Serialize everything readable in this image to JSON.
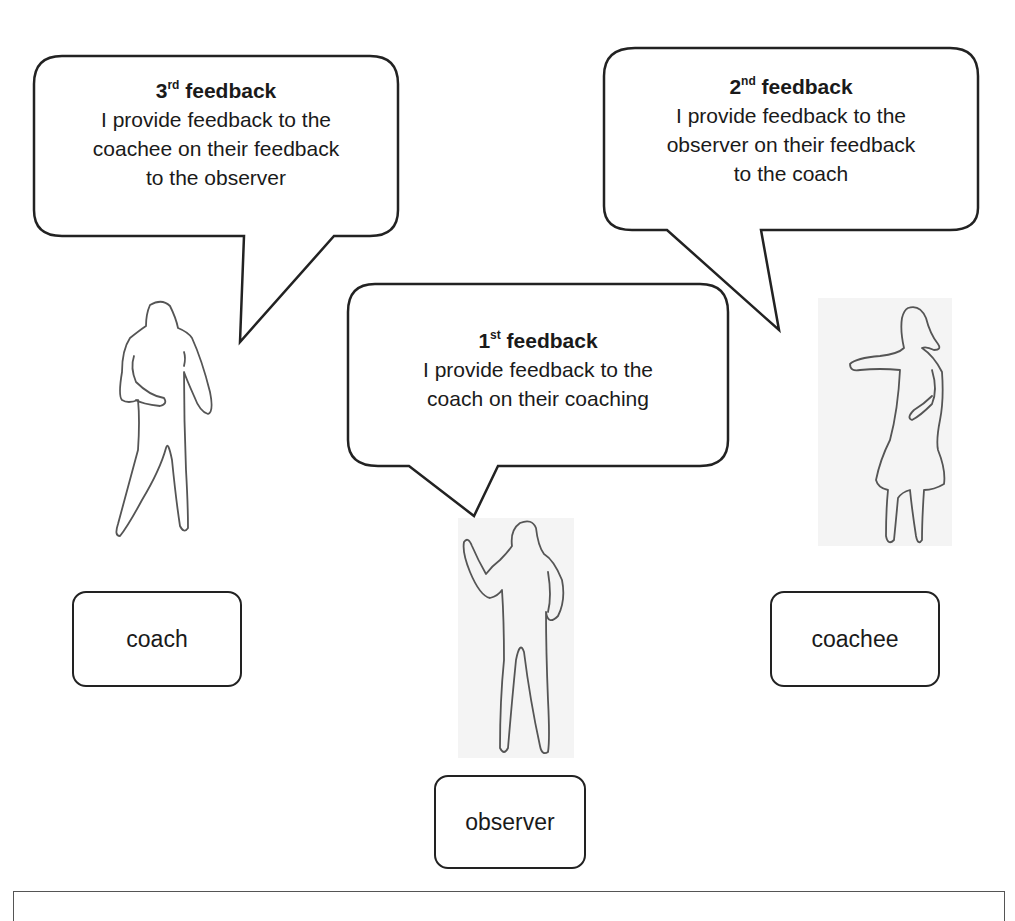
{
  "diagram": {
    "bubbles": [
      {
        "id": "third",
        "ordinal_number": "3",
        "ordinal_suffix": "rd",
        "title_word": "feedback",
        "lines": [
          "I provide feedback to the",
          "coachee on their feedback",
          "to the observer"
        ],
        "speaker": "coach"
      },
      {
        "id": "second",
        "ordinal_number": "2",
        "ordinal_suffix": "nd",
        "title_word": "feedback",
        "lines": [
          "I provide feedback to the",
          "observer on their feedback",
          "to the coach"
        ],
        "speaker": "coachee"
      },
      {
        "id": "first",
        "ordinal_number": "1",
        "ordinal_suffix": "st",
        "title_word": "feedback",
        "lines": [
          "I provide feedback to the",
          "coach on their coaching"
        ],
        "speaker": "observer"
      }
    ],
    "roles": [
      {
        "id": "coach",
        "label": "coach"
      },
      {
        "id": "observer",
        "label": "observer"
      },
      {
        "id": "coachee",
        "label": "coachee"
      }
    ],
    "colors": {
      "stroke": "#222222",
      "figure_outline": "#555555",
      "figure_bg": "#f4f4f4"
    }
  }
}
